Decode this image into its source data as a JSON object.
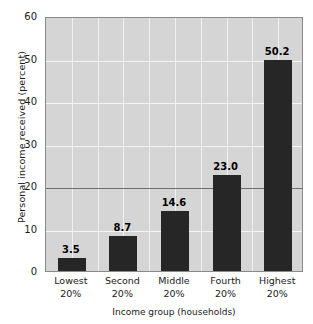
{
  "chart_data": {
    "type": "bar",
    "title": "",
    "subtitle": "",
    "xlabel": "Income group (households)",
    "ylabel": "Personal income received (percent)",
    "categories": [
      "Lowest 20%",
      "Second 20%",
      "Middle 20%",
      "Fourth 20%",
      "Highest 20%"
    ],
    "category_lines": [
      {
        "line1": "Lowest",
        "line2": "20%"
      },
      {
        "line1": "Second",
        "line2": "20%"
      },
      {
        "line1": "Middle",
        "line2": "20%"
      },
      {
        "line1": "Fourth",
        "line2": "20%"
      },
      {
        "line1": "Highest",
        "line2": "20%"
      }
    ],
    "values": [
      3.5,
      8.7,
      14.6,
      23.0,
      50.2
    ],
    "value_labels": [
      "3.5",
      "8.7",
      "14.6",
      "23.0",
      "50.2"
    ],
    "ylim": [
      0,
      60
    ],
    "xlim": [
      0,
      5
    ],
    "ytick_labels": [
      "60",
      "50",
      "40",
      "30",
      "20",
      "10",
      "0"
    ],
    "yticks": [
      60,
      50,
      40,
      30,
      20,
      10,
      0
    ],
    "grid": "both",
    "gridline_color": "#f4f4f4",
    "reference_line_value": 20,
    "reference_line_color": "#6e6e6e",
    "legend": "none",
    "bar_color": "#262626",
    "plot_background": "#d5d5d5",
    "page_background": "#ffffff",
    "axis_color": "#8a8a8a",
    "text_color": "#1a1a1a",
    "vertical_gridline_count": 9
  }
}
